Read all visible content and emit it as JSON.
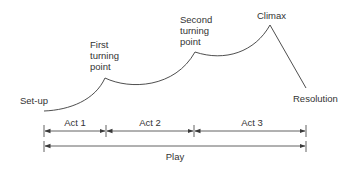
{
  "diagram": {
    "colors": {
      "line": "#3a3a3a",
      "text": "#333333",
      "background": "#ffffff"
    },
    "labels": {
      "setup": "Set-up",
      "first_turning_point": [
        "First",
        "turning",
        "point"
      ],
      "second_turning_point": [
        "Second",
        "turning",
        "point"
      ],
      "climax": "Climax",
      "resolution": "Resolution"
    },
    "acts": [
      {
        "label": "Act 1"
      },
      {
        "label": "Act 2"
      },
      {
        "label": "Act 3"
      }
    ],
    "play": {
      "label": "Play"
    }
  }
}
